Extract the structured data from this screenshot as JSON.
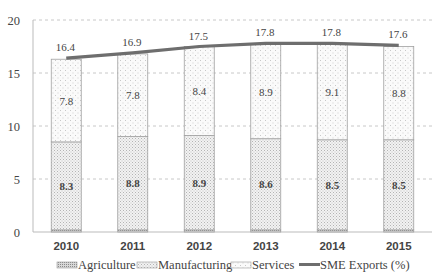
{
  "chart_data": {
    "type": "bar",
    "stacked": true,
    "title": "",
    "xlabel": "",
    "ylabel": "",
    "ylim": [
      0,
      20
    ],
    "yticks": [
      0,
      5,
      10,
      15,
      20
    ],
    "grid": "horizontal dashed",
    "legend_position": "bottom",
    "categories": [
      "2010",
      "2011",
      "2012",
      "2013",
      "2014",
      "2015"
    ],
    "series": [
      {
        "name": "Agriculture",
        "kind": "bar",
        "pattern": "dense-dots",
        "values": [
          0.2,
          0.2,
          0.2,
          0.2,
          0.2,
          0.2
        ]
      },
      {
        "name": "Manufacturing",
        "kind": "bar",
        "pattern": "medium-dots",
        "values": [
          8.3,
          8.8,
          8.9,
          8.6,
          8.5,
          8.5
        ]
      },
      {
        "name": "Services",
        "kind": "bar",
        "pattern": "sparse-dots",
        "values": [
          7.8,
          7.8,
          8.4,
          8.9,
          9.1,
          8.8
        ]
      },
      {
        "name": "SME Exports (%)",
        "kind": "line",
        "values": [
          16.4,
          16.9,
          17.5,
          17.8,
          17.8,
          17.6
        ]
      }
    ]
  },
  "legend": {
    "agriculture": "Agriculture",
    "manufacturing": "Manufacturing",
    "services": "Services",
    "sme_exports": "SME Exports (%)"
  },
  "colors": {
    "line": "#6e6e6e",
    "bar_border": "#a0a0a0",
    "grid": "#c8c8c8",
    "axis": "#bbbbbb",
    "text": "#444444"
  }
}
